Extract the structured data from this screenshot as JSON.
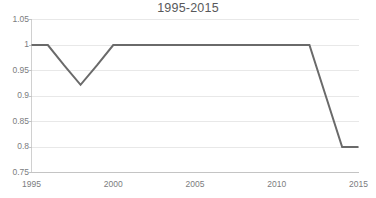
{
  "chart_data": {
    "type": "line",
    "title": "1995-2015",
    "xlabel": "",
    "ylabel": "",
    "xlim": [
      1995,
      2015
    ],
    "ylim": [
      0.75,
      1.05
    ],
    "grid": true,
    "legend": null,
    "legend_position": "none",
    "line_color": "#6a6a6a",
    "gridline_color": "#e8e8e8",
    "axis_color": "#d0d0d0",
    "background_color": "#ffffff",
    "x_ticks": [
      1995,
      2000,
      2005,
      2010,
      2015
    ],
    "x_tick_labels": [
      "1995",
      "2000",
      "2005",
      "2010",
      "2015"
    ],
    "y_ticks": [
      0.75,
      0.8,
      0.85,
      0.9,
      0.95,
      1,
      1.05
    ],
    "y_tick_labels": [
      "0.75",
      "0.8",
      "0.85",
      "0.9",
      "0.95",
      "1",
      "1.05"
    ],
    "x": [
      1995,
      1996,
      1997,
      1998,
      1999,
      2000,
      2001,
      2002,
      2003,
      2004,
      2005,
      2006,
      2007,
      2008,
      2009,
      2010,
      2011,
      2012,
      2013,
      2014,
      2015
    ],
    "values": [
      1,
      1,
      0.96,
      0.922,
      0.96,
      1,
      1,
      1,
      1,
      1,
      1,
      1,
      1,
      1,
      1,
      1,
      1,
      1,
      0.9,
      0.8,
      0.8
    ]
  }
}
